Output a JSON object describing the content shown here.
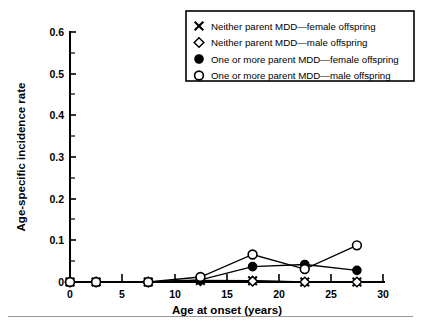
{
  "chart_data": {
    "type": "line",
    "title": "",
    "xlabel": "Age at onset (years)",
    "ylabel": "Age-specific incidence rate",
    "xlim": [
      0,
      30
    ],
    "ylim": [
      0,
      0.6
    ],
    "xticks": [
      0,
      5,
      10,
      15,
      20,
      25,
      30
    ],
    "xticklabels": [
      "0",
      "5",
      "10",
      "15",
      "20",
      "25",
      "30"
    ],
    "yticks": [
      0,
      0.1,
      0.2,
      0.3,
      0.4,
      0.5,
      0.6
    ],
    "yticklabels": [
      "0",
      "0.1",
      "0.2",
      "0.3",
      "0.4",
      "0.5",
      "0.6"
    ],
    "y_minor_ticks": [
      0.05,
      0.15,
      0.25,
      0.35,
      0.45,
      0.55
    ],
    "grid": false,
    "legend_position": "top-right",
    "x": [
      0,
      2.5,
      7.5,
      12.5,
      17.5,
      22.5,
      27.5
    ],
    "series": [
      {
        "name": "Neither parent MDD—female offspring",
        "marker": "x",
        "values": [
          0,
          0,
          0,
          0.004,
          0.003,
          0,
          0
        ]
      },
      {
        "name": "Neither parent MDD—male offspring",
        "marker": "diamond-open",
        "values": [
          0,
          0,
          0,
          0.003,
          0.002,
          0,
          0
        ]
      },
      {
        "name": "One or more parent MDD—female offspring",
        "marker": "circle-filled",
        "values": [
          0,
          0,
          0,
          0.005,
          0.037,
          0.042,
          0.028
        ]
      },
      {
        "name": "One or more parent MDD—male offspring",
        "marker": "circle-open",
        "values": [
          0,
          0,
          0,
          0.012,
          0.066,
          0.031,
          0.088
        ]
      }
    ]
  },
  "legend": {
    "items": [
      {
        "marker": "x",
        "label": "Neither parent MDD—female offspring"
      },
      {
        "marker": "diamond-open",
        "label": "Neither parent MDD—male offspring"
      },
      {
        "marker": "circle-filled",
        "label": "One or more parent MDD—female offspring"
      },
      {
        "marker": "circle-open",
        "label": "One or more parent MDD—male offspring"
      }
    ]
  },
  "colors": {
    "ink": "#000000",
    "background": "#ffffff",
    "rule": "#9a9a9a"
  }
}
